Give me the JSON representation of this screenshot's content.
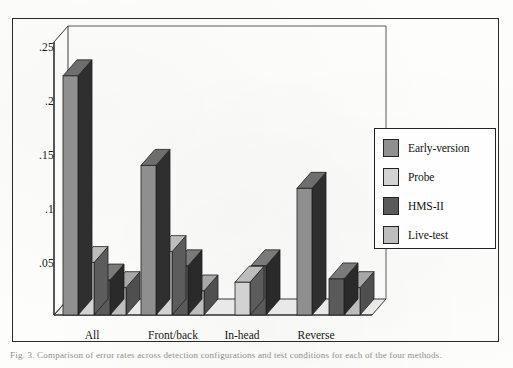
{
  "figure": {
    "frame_visible": true,
    "background_color": "#fdfdfc",
    "border_color": "#2a2a2a"
  },
  "caption": {
    "text": "Fig. 3. Comparison of error rates across detection configurations and test conditions for each of the four methods."
  },
  "legend": {
    "position": "right",
    "border_color": "#222222",
    "entries": [
      {
        "label": "Early-version",
        "color": "#8f8f8f"
      },
      {
        "label": "Probe",
        "color": "#d2d2d2"
      },
      {
        "label": "HMS-II",
        "color": "#5a5a5a"
      },
      {
        "label": "Live-test",
        "color": "#bdbdbd"
      }
    ]
  },
  "chart_data": {
    "type": "bar",
    "title": "",
    "xlabel": "",
    "ylabel": "",
    "grid": false,
    "three_d": true,
    "categories": [
      "All",
      "Front/back",
      "In-head",
      "Reverse"
    ],
    "ytick_labels": [
      ".25",
      ".2",
      ".15",
      ".1",
      ".05"
    ],
    "ytick_values": [
      0.25,
      0.2,
      0.15,
      0.1,
      0.05
    ],
    "ylim": [
      0,
      0.25
    ],
    "series": [
      {
        "name": "Early-version",
        "color": "#8f8f8f",
        "top_color": "#6e6e6e",
        "side_color": "#2f2f2f",
        "values": [
          0.219,
          0.137,
          0.0,
          0.116
        ]
      },
      {
        "name": "Probe",
        "color": "#d2d2d2",
        "top_color": "#bdbdbd",
        "side_color": "#5c5c5c",
        "values": [
          0.048,
          0.058,
          0.03,
          0.0
        ]
      },
      {
        "name": "HMS-II",
        "color": "#5a5a5a",
        "top_color": "#7a7a7a",
        "side_color": "#2a2a2a",
        "values": [
          0.032,
          0.045,
          0.045,
          0.033
        ]
      },
      {
        "name": "Live-test",
        "color": "#bdbdbd",
        "top_color": "#a8a8a8",
        "side_color": "#4f4f4f",
        "values": [
          0.025,
          0.022,
          0.0,
          0.025
        ]
      }
    ]
  }
}
